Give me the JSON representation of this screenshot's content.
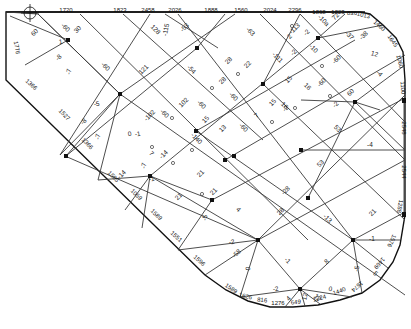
{
  "diagram": {
    "caption": "",
    "colors": {
      "line": "#3a3a3a",
      "edge": "#111111",
      "text": "#222222",
      "background": "#ffffff"
    },
    "nodes": [
      {
        "id": "n1",
        "x": 238,
        "y": 131
      },
      {
        "id": "n2",
        "x": 120,
        "y": 94
      },
      {
        "id": "n3",
        "x": 197,
        "y": 48
      },
      {
        "id": "n4",
        "x": 263,
        "y": 140
      },
      {
        "id": "n5",
        "x": 318,
        "y": 38
      },
      {
        "id": "n6",
        "x": 355,
        "y": 102
      },
      {
        "id": "n7",
        "x": 196,
        "y": 131
      },
      {
        "id": "n8",
        "x": 150,
        "y": 176
      },
      {
        "id": "n9",
        "x": 212,
        "y": 200
      },
      {
        "id": "n10",
        "x": 308,
        "y": 198
      },
      {
        "id": "n11",
        "x": 258,
        "y": 240
      },
      {
        "id": "n12",
        "x": 353,
        "y": 240
      },
      {
        "id": "n13",
        "x": 263,
        "y": 84
      },
      {
        "id": "n14",
        "x": 225,
        "y": 160
      },
      {
        "id": "n15",
        "x": 301,
        "y": 118
      },
      {
        "id": "n16",
        "x": 66,
        "y": 156
      },
      {
        "id": "n17",
        "x": 60,
        "y": 155
      }
    ],
    "boundary_labels": [
      {
        "text": "1720",
        "x": 66,
        "y": 12,
        "rot": 0
      },
      {
        "text": "1823",
        "x": 120,
        "y": 12,
        "rot": 0
      },
      {
        "text": "2458",
        "x": 148,
        "y": 12,
        "rot": 0
      },
      {
        "text": "2026",
        "x": 175,
        "y": 12,
        "rot": 0
      },
      {
        "text": "1888",
        "x": 211,
        "y": 12,
        "rot": 0
      },
      {
        "text": "1560",
        "x": 241,
        "y": 12,
        "rot": 0
      },
      {
        "text": "2024",
        "x": 270,
        "y": 12,
        "rot": 0
      },
      {
        "text": "2296",
        "x": 295,
        "y": 12,
        "rot": 0
      },
      {
        "text": "1868",
        "x": 319,
        "y": 14,
        "rot": 0
      },
      {
        "text": "1823",
        "x": 338,
        "y": 14,
        "rot": 0
      },
      {
        "text": "836",
        "x": 352,
        "y": 15,
        "rot": 0
      },
      {
        "text": "1013",
        "x": 363,
        "y": 17,
        "rot": 15
      },
      {
        "text": "1460",
        "x": 378,
        "y": 27,
        "rot": 40
      },
      {
        "text": "1645",
        "x": 391,
        "y": 42,
        "rot": 55
      },
      {
        "text": "1060",
        "x": 398,
        "y": 62,
        "rot": 75
      },
      {
        "text": "1100",
        "x": 401,
        "y": 88,
        "rot": 85
      },
      {
        "text": "2548",
        "x": 402,
        "y": 128,
        "rot": 90
      },
      {
        "text": "2544",
        "x": 402,
        "y": 172,
        "rot": 90
      },
      {
        "text": "1288",
        "x": 398,
        "y": 206,
        "rot": 100
      },
      {
        "text": "1576",
        "x": 390,
        "y": 240,
        "rot": 115
      },
      {
        "text": "1469",
        "x": 378,
        "y": 262,
        "rot": 130
      },
      {
        "text": "1674",
        "x": 356,
        "y": 285,
        "rot": 140
      },
      {
        "text": "1440",
        "x": 340,
        "y": 293,
        "rot": -20
      },
      {
        "text": "1224",
        "x": 320,
        "y": 300,
        "rot": -15
      },
      {
        "text": "649",
        "x": 296,
        "y": 304,
        "rot": -5
      },
      {
        "text": "1276",
        "x": 278,
        "y": 305,
        "rot": 0
      },
      {
        "text": "816",
        "x": 262,
        "y": 302,
        "rot": 5
      },
      {
        "text": "1626",
        "x": 245,
        "y": 298,
        "rot": 15
      },
      {
        "text": "1589",
        "x": 230,
        "y": 290,
        "rot": 35
      },
      {
        "text": "1596",
        "x": 198,
        "y": 262,
        "rot": 42
      },
      {
        "text": "1551",
        "x": 175,
        "y": 238,
        "rot": 43
      },
      {
        "text": "1589",
        "x": 155,
        "y": 216,
        "rot": 44
      },
      {
        "text": "1059",
        "x": 135,
        "y": 196,
        "rot": 44
      },
      {
        "text": "1505",
        "x": 112,
        "y": 178,
        "rot": 45
      },
      {
        "text": "1366",
        "x": 86,
        "y": 145,
        "rot": 46
      },
      {
        "text": "1527",
        "x": 63,
        "y": 116,
        "rot": 46
      },
      {
        "text": "1366",
        "x": 30,
        "y": 86,
        "rot": 42
      },
      {
        "text": "1776",
        "x": 15,
        "y": 48,
        "rot": 80
      }
    ],
    "member_labels": [
      {
        "text": "60",
        "x": 36,
        "y": 34,
        "rot": -45
      },
      {
        "text": "-60",
        "x": 64,
        "y": 29,
        "rot": 45
      },
      {
        "text": "30",
        "x": 79,
        "y": 31,
        "rot": -45
      },
      {
        "text": "1",
        "x": 61,
        "y": 44,
        "rot": -10
      },
      {
        "text": "-8",
        "x": 60,
        "y": 59,
        "rot": -45
      },
      {
        "text": "-7",
        "x": 71,
        "y": 72,
        "rot": -80
      },
      {
        "text": "-60",
        "x": 104,
        "y": 68,
        "rot": 45
      },
      {
        "text": "128",
        "x": 154,
        "y": 31,
        "rot": 45
      },
      {
        "text": "-115",
        "x": 168,
        "y": 30,
        "rot": -80
      },
      {
        "text": "-53",
        "x": 186,
        "y": 29,
        "rot": -45
      },
      {
        "text": "121",
        "x": 145,
        "y": 71,
        "rot": -45
      },
      {
        "text": "-54",
        "x": 190,
        "y": 71,
        "rot": 45
      },
      {
        "text": "-63",
        "x": 249,
        "y": 33,
        "rot": 45
      },
      {
        "text": "22",
        "x": 249,
        "y": 66,
        "rot": -45
      },
      {
        "text": "28",
        "x": 230,
        "y": 62,
        "rot": -45
      },
      {
        "text": "28",
        "x": 224,
        "y": 82,
        "rot": -45
      },
      {
        "text": "-111",
        "x": 276,
        "y": 59,
        "rot": 45
      },
      {
        "text": "-113",
        "x": 296,
        "y": 30,
        "rot": -45
      },
      {
        "text": "2",
        "x": 291,
        "y": 38,
        "rot": -45
      },
      {
        "text": "-10a",
        "x": 322,
        "y": 22,
        "rot": 45
      },
      {
        "text": "72",
        "x": 337,
        "y": 18,
        "rot": -45
      },
      {
        "text": "-37",
        "x": 348,
        "y": 37,
        "rot": 45
      },
      {
        "text": "-38",
        "x": 365,
        "y": 37,
        "rot": -45
      },
      {
        "text": "12",
        "x": 374,
        "y": 56,
        "rot": 15
      },
      {
        "text": "-2",
        "x": 308,
        "y": 34,
        "rot": -45
      },
      {
        "text": "-2",
        "x": 295,
        "y": 54,
        "rot": -45
      },
      {
        "text": "-10",
        "x": 312,
        "y": 50,
        "rot": 45
      },
      {
        "text": "-60",
        "x": 338,
        "y": 61,
        "rot": -45
      },
      {
        "text": "-4",
        "x": 378,
        "y": 75,
        "rot": 45
      },
      {
        "text": "15",
        "x": 290,
        "y": 81,
        "rot": -45
      },
      {
        "text": "16",
        "x": 306,
        "y": 88,
        "rot": 45
      },
      {
        "text": "-60",
        "x": 323,
        "y": 84,
        "rot": -45
      },
      {
        "text": "60",
        "x": 352,
        "y": 94,
        "rot": -45
      },
      {
        "text": "-2",
        "x": 337,
        "y": 106,
        "rot": -45
      },
      {
        "text": "15",
        "x": 274,
        "y": 104,
        "rot": -45
      },
      {
        "text": "16",
        "x": 283,
        "y": 107,
        "rot": 45
      },
      {
        "text": "-102",
        "x": 151,
        "y": 117,
        "rot": -45
      },
      {
        "text": "-60",
        "x": 163,
        "y": 115,
        "rot": 45
      },
      {
        "text": "102",
        "x": 185,
        "y": 104,
        "rot": -45
      },
      {
        "text": "-60",
        "x": 200,
        "y": 106,
        "rot": 45
      },
      {
        "text": "15",
        "x": 207,
        "y": 121,
        "rot": -45
      },
      {
        "text": "-60",
        "x": 232,
        "y": 98,
        "rot": 45
      },
      {
        "text": "-60",
        "x": 242,
        "y": 129,
        "rot": 45
      },
      {
        "text": "13",
        "x": 224,
        "y": 130,
        "rot": -45
      },
      {
        "text": "7",
        "x": 258,
        "y": 117,
        "rot": -45
      },
      {
        "text": "-2",
        "x": 287,
        "y": 110,
        "rot": -45
      },
      {
        "text": "53",
        "x": 336,
        "y": 130,
        "rot": 45
      },
      {
        "text": "53",
        "x": 322,
        "y": 165,
        "rot": -45
      },
      {
        "text": "-4",
        "x": 370,
        "y": 147,
        "rot": 0
      },
      {
        "text": "-1",
        "x": 138,
        "y": 136,
        "rot": -10
      },
      {
        "text": "-5",
        "x": 97,
        "y": 106,
        "rot": -10
      },
      {
        "text": "-8",
        "x": 85,
        "y": 123,
        "rot": -45
      },
      {
        "text": "-7",
        "x": 100,
        "y": 137,
        "rot": -80
      },
      {
        "text": "0",
        "x": 130,
        "y": 136,
        "rot": -10
      },
      {
        "text": "7",
        "x": 150,
        "y": 155,
        "rot": 45
      },
      {
        "text": "-7",
        "x": 146,
        "y": 166,
        "rot": -80
      },
      {
        "text": "-14",
        "x": 165,
        "y": 156,
        "rot": -45
      },
      {
        "text": "-140",
        "x": 195,
        "y": 140,
        "rot": 45
      },
      {
        "text": "-14",
        "x": 123,
        "y": 176,
        "rot": -45
      },
      {
        "text": "-1",
        "x": 152,
        "y": 181,
        "rot": -10
      },
      {
        "text": "21",
        "x": 202,
        "y": 175,
        "rot": -45
      },
      {
        "text": "21",
        "x": 180,
        "y": 198,
        "rot": -45
      },
      {
        "text": "21",
        "x": 215,
        "y": 193,
        "rot": -45
      },
      {
        "text": "-5",
        "x": 207,
        "y": 218,
        "rot": -80
      },
      {
        "text": "4",
        "x": 237,
        "y": 211,
        "rot": 45
      },
      {
        "text": "28",
        "x": 282,
        "y": 213,
        "rot": -45
      },
      {
        "text": "-28",
        "x": 287,
        "y": 192,
        "rot": -45
      },
      {
        "text": "-13",
        "x": 326,
        "y": 220,
        "rot": 45
      },
      {
        "text": "21",
        "x": 374,
        "y": 214,
        "rot": -45
      },
      {
        "text": "-1",
        "x": 372,
        "y": 241,
        "rot": 0
      },
      {
        "text": "-2",
        "x": 232,
        "y": 244,
        "rot": -10
      },
      {
        "text": "-58",
        "x": 238,
        "y": 255,
        "rot": -45
      },
      {
        "text": "0",
        "x": 250,
        "y": 269,
        "rot": -80
      },
      {
        "text": "-1",
        "x": 286,
        "y": 262,
        "rot": 45
      },
      {
        "text": "8",
        "x": 328,
        "y": 263,
        "rot": -45
      },
      {
        "text": "-5",
        "x": 359,
        "y": 269,
        "rot": -80
      },
      {
        "text": "-2",
        "x": 276,
        "y": 291,
        "rot": -10
      },
      {
        "text": "0",
        "x": 330,
        "y": 291,
        "rot": 10
      },
      {
        "text": "4",
        "x": 290,
        "y": 300,
        "rot": -45
      },
      {
        "text": "12",
        "x": 307,
        "y": 297,
        "rot": -80
      },
      {
        "text": "12",
        "x": 316,
        "y": 299,
        "rot": 45
      },
      {
        "text": "5",
        "x": 374,
        "y": 275,
        "rot": 45
      }
    ]
  }
}
